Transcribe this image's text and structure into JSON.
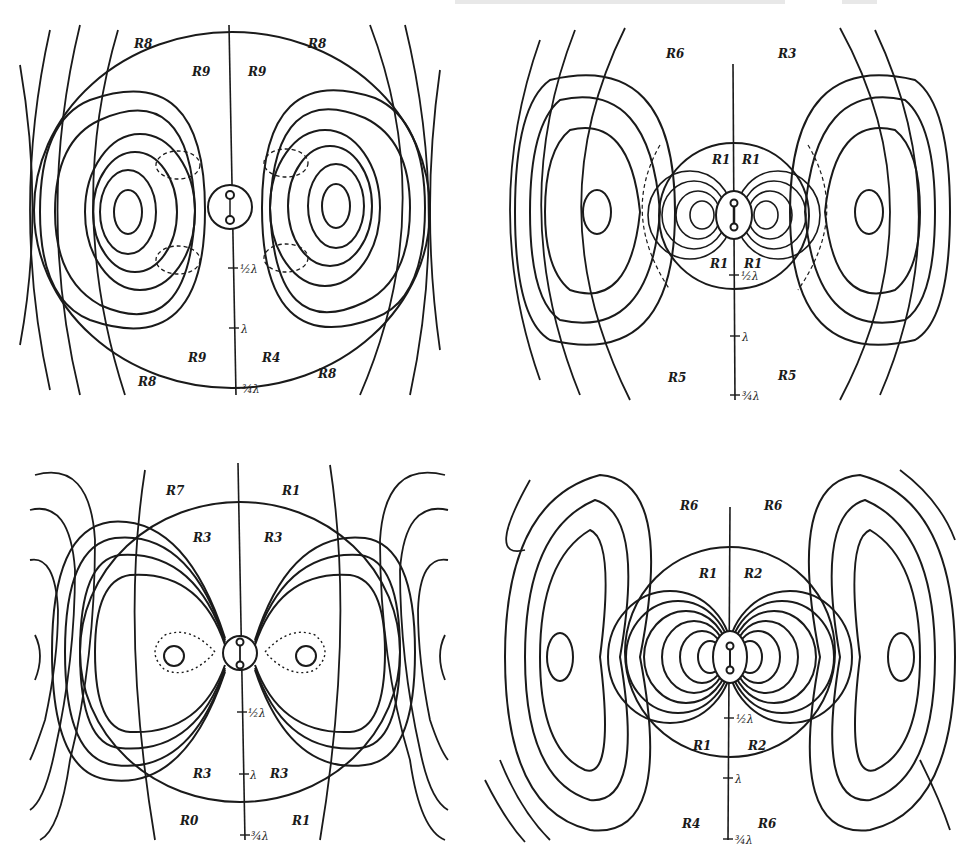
{
  "page": {
    "colors": {
      "ink": "#1a1a1a",
      "paper": "#ffffff"
    }
  },
  "panels": [
    {
      "id": "top-left",
      "region_labels": {
        "outer_tl": "R8",
        "outer_tr": "R8",
        "inner_tl": "R9",
        "inner_tr": "R9",
        "inner_bl": "R9",
        "inner_br": "R4",
        "outer_bl": "R8",
        "outer_br": "R8"
      },
      "axis_ticks": [
        "½λ",
        "λ",
        "¾λ"
      ]
    },
    {
      "id": "top-right",
      "region_labels": {
        "outer_tl": "R6",
        "outer_tr": "R3",
        "inner_tl": "R1",
        "inner_tr": "R1",
        "inner_bl": "R1",
        "inner_br": "R1",
        "outer_bl": "R5",
        "outer_br": "R5"
      },
      "axis_ticks": [
        "½λ",
        "λ",
        "¾λ"
      ]
    },
    {
      "id": "bottom-left",
      "region_labels": {
        "outer_tl": "R7",
        "outer_tr": "R1",
        "inner_tl": "R3",
        "inner_tr": "R3",
        "inner_bl": "R3",
        "inner_br": "R3",
        "outer_bl": "R0",
        "outer_br": "R1"
      },
      "axis_ticks": [
        "½λ",
        "λ",
        "¾λ"
      ]
    },
    {
      "id": "bottom-right",
      "region_labels": {
        "outer_tl": "R6",
        "outer_tr": "R6",
        "inner_tl": "R1",
        "inner_tr": "R2",
        "inner_bl": "R1",
        "inner_br": "R2",
        "outer_bl": "R4",
        "outer_br": "R6"
      },
      "axis_ticks": [
        "½λ",
        "λ",
        "¾λ"
      ]
    }
  ]
}
